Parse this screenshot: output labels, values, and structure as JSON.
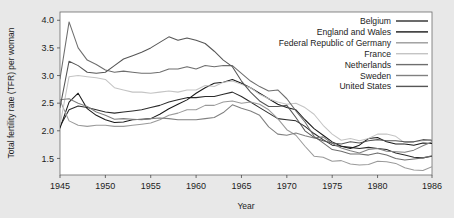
{
  "chart_data": {
    "type": "line",
    "title": "",
    "xlabel": "Year",
    "ylabel": "Total fertility rate (TFR) per woman",
    "xlim": [
      1945,
      1986
    ],
    "ylim": [
      1.2,
      4.15
    ],
    "grid": false,
    "legend_position": "top-right",
    "xticks": [
      1945,
      1950,
      1955,
      1960,
      1965,
      1970,
      1975,
      1980,
      1986
    ],
    "xtick_labels": [
      "1945",
      "1950",
      "1955",
      "1960",
      "1965",
      "1970",
      "1975",
      "1980",
      "1986"
    ],
    "yticks": [
      1.5,
      2.0,
      2.5,
      3.0,
      3.5,
      4.0
    ],
    "ytick_labels": [
      "1.5",
      "2.0",
      "2.5",
      "3.0",
      "3.5",
      "4.0"
    ],
    "x": [
      1945,
      1946,
      1947,
      1948,
      1949,
      1950,
      1951,
      1952,
      1953,
      1954,
      1955,
      1956,
      1957,
      1958,
      1959,
      1960,
      1961,
      1962,
      1963,
      1964,
      1965,
      1966,
      1967,
      1968,
      1969,
      1970,
      1971,
      1972,
      1973,
      1974,
      1975,
      1976,
      1977,
      1978,
      1979,
      1980,
      1981,
      1982,
      1983,
      1984,
      1985,
      1986
    ],
    "series": [
      {
        "name": "Belgium",
        "color": "#2b2b2b",
        "values": [
          2.08,
          2.38,
          2.45,
          2.42,
          2.38,
          2.34,
          2.32,
          2.34,
          2.36,
          2.38,
          2.42,
          2.46,
          2.52,
          2.56,
          2.6,
          2.6,
          2.62,
          2.62,
          2.66,
          2.7,
          2.62,
          2.52,
          2.42,
          2.32,
          2.22,
          2.2,
          2.18,
          2.08,
          1.95,
          1.84,
          1.74,
          1.72,
          1.7,
          1.68,
          1.7,
          1.68,
          1.66,
          1.6,
          1.56,
          1.52,
          1.51,
          1.54
        ]
      },
      {
        "name": "England and Wales",
        "color": "#1a1a1a",
        "values": [
          2.05,
          2.52,
          2.68,
          2.4,
          2.28,
          2.2,
          2.15,
          2.16,
          2.2,
          2.21,
          2.22,
          2.3,
          2.4,
          2.48,
          2.56,
          2.68,
          2.78,
          2.86,
          2.88,
          2.93,
          2.86,
          2.78,
          2.68,
          2.58,
          2.48,
          2.42,
          2.38,
          2.2,
          2.04,
          1.92,
          1.8,
          1.72,
          1.68,
          1.74,
          1.86,
          1.88,
          1.8,
          1.76,
          1.76,
          1.74,
          1.78,
          1.77
        ]
      },
      {
        "name": "Federal Republic of Germany",
        "color": "#9a9a9a",
        "values": [
          2.55,
          2.18,
          2.1,
          2.08,
          2.1,
          2.1,
          2.08,
          2.08,
          2.1,
          2.12,
          2.14,
          2.2,
          2.28,
          2.32,
          2.38,
          2.38,
          2.46,
          2.46,
          2.52,
          2.54,
          2.5,
          2.52,
          2.48,
          2.38,
          2.22,
          2.02,
          1.92,
          1.72,
          1.54,
          1.52,
          1.45,
          1.46,
          1.4,
          1.38,
          1.39,
          1.45,
          1.44,
          1.41,
          1.33,
          1.29,
          1.28,
          1.35
        ]
      },
      {
        "name": "France",
        "color": "#c4c4c4",
        "values": [
          2.1,
          2.98,
          3.0,
          2.98,
          2.96,
          2.93,
          2.78,
          2.74,
          2.7,
          2.7,
          2.68,
          2.7,
          2.72,
          2.7,
          2.74,
          2.74,
          2.82,
          2.8,
          2.88,
          2.9,
          2.84,
          2.78,
          2.66,
          2.58,
          2.52,
          2.48,
          2.5,
          2.42,
          2.3,
          2.1,
          1.94,
          1.83,
          1.86,
          1.82,
          1.86,
          1.94,
          1.94,
          1.9,
          1.78,
          1.8,
          1.82,
          1.84
        ]
      },
      {
        "name": "Netherlands",
        "color": "#6e6e6e",
        "values": [
          2.94,
          3.97,
          3.5,
          3.28,
          3.2,
          3.1,
          3.06,
          3.08,
          3.06,
          3.04,
          3.04,
          3.06,
          3.12,
          3.12,
          3.16,
          3.12,
          3.18,
          3.16,
          3.18,
          3.18,
          3.04,
          2.9,
          2.8,
          2.72,
          2.74,
          2.58,
          2.36,
          2.16,
          1.9,
          1.78,
          1.66,
          1.63,
          1.58,
          1.58,
          1.56,
          1.6,
          1.56,
          1.5,
          1.47,
          1.49,
          1.51,
          1.55
        ]
      },
      {
        "name": "Sweden",
        "color": "#808080",
        "values": [
          2.56,
          2.58,
          2.5,
          2.44,
          2.34,
          2.28,
          2.21,
          2.22,
          2.21,
          2.2,
          2.22,
          2.23,
          2.22,
          2.2,
          2.2,
          2.2,
          2.22,
          2.24,
          2.33,
          2.47,
          2.41,
          2.36,
          2.28,
          2.07,
          1.94,
          1.92,
          1.96,
          1.91,
          1.87,
          1.89,
          1.77,
          1.69,
          1.64,
          1.6,
          1.66,
          1.68,
          1.63,
          1.62,
          1.61,
          1.65,
          1.73,
          1.8
        ]
      },
      {
        "name": "United States",
        "color": "#565656",
        "values": [
          2.42,
          3.26,
          3.18,
          3.06,
          3.04,
          3.06,
          3.18,
          3.3,
          3.36,
          3.42,
          3.5,
          3.6,
          3.7,
          3.64,
          3.68,
          3.64,
          3.58,
          3.44,
          3.28,
          3.16,
          2.9,
          2.7,
          2.54,
          2.44,
          2.44,
          2.46,
          2.24,
          2.0,
          1.88,
          1.82,
          1.78,
          1.76,
          1.8,
          1.78,
          1.82,
          1.84,
          1.82,
          1.82,
          1.8,
          1.8,
          1.84,
          1.83
        ]
      }
    ]
  },
  "axes": {
    "ylabel": "Total fertility rate (TFR) per woman",
    "xlabel": "Year"
  },
  "legend": {
    "items": [
      {
        "label": "Belgium",
        "color": "#2b2b2b"
      },
      {
        "label": "England and Wales",
        "color": "#1a1a1a"
      },
      {
        "label": "Federal Republic of Germany",
        "color": "#9a9a9a"
      },
      {
        "label": "France",
        "color": "#c4c4c4"
      },
      {
        "label": "Netherlands",
        "color": "#6e6e6e"
      },
      {
        "label": "Sweden",
        "color": "#808080"
      },
      {
        "label": "United States",
        "color": "#565656"
      }
    ]
  }
}
